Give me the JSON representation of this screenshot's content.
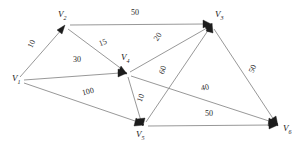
{
  "diagram": {
    "width": 303,
    "height": 148,
    "background_color": "#ffffff",
    "edge_color": "#8c8c8c",
    "arrow_color": "#1c1c1c",
    "label_color": "#151515"
  },
  "nodes": [
    {
      "id": "v1",
      "name": "V",
      "subscript": "1",
      "label": "V1",
      "x": 20,
      "y": 80,
      "label_x": 12,
      "label_y": 76
    },
    {
      "id": "v2",
      "name": "V",
      "subscript": "2",
      "label": "V2",
      "x": 65,
      "y": 28,
      "label_x": 58,
      "label_y": 12
    },
    {
      "id": "v3",
      "name": "V",
      "subscript": "3",
      "label": "V3",
      "x": 210,
      "y": 24,
      "label_x": 215,
      "label_y": 12
    },
    {
      "id": "v4",
      "name": "V",
      "subscript": "4",
      "label": "V4",
      "x": 126,
      "y": 74,
      "label_x": 122,
      "label_y": 55
    },
    {
      "id": "v5",
      "name": "V",
      "subscript": "5",
      "label": "V5",
      "x": 143,
      "y": 126,
      "label_x": 136,
      "label_y": 130
    },
    {
      "id": "v6",
      "name": "V",
      "subscript": "6",
      "label": "V6",
      "x": 277,
      "y": 125,
      "label_x": 283,
      "label_y": 124
    }
  ],
  "edges": [
    {
      "id": "e-v1-v2",
      "from": "v1",
      "to": "v2",
      "weight": "10",
      "label_x": 33,
      "label_y": 44,
      "rotate": -64
    },
    {
      "id": "e-v2-v3",
      "from": "v2",
      "to": "v3",
      "weight": "50",
      "label_x": 136,
      "label_y": 13,
      "rotate": 0
    },
    {
      "id": "e-v2-v4",
      "from": "v2",
      "to": "v4",
      "weight": "15",
      "label_x": 104,
      "label_y": 43,
      "rotate": -22
    },
    {
      "id": "e-v1-v4",
      "from": "v1",
      "to": "v4",
      "weight": "30",
      "label_x": 78,
      "label_y": 60,
      "rotate": 0
    },
    {
      "id": "e-v1-v5",
      "from": "v1",
      "to": "v5",
      "weight": "100",
      "label_x": 89,
      "label_y": 92,
      "rotate": -14
    },
    {
      "id": "e-v4-v3",
      "from": "v4",
      "to": "v3",
      "weight": "20",
      "label_x": 159,
      "label_y": 37,
      "rotate": -56
    },
    {
      "id": "e-v4-v5",
      "from": "v4",
      "to": "v5",
      "weight": "10",
      "label_x": 142,
      "label_y": 98,
      "rotate": -70
    },
    {
      "id": "e-v4-v6",
      "from": "v4",
      "to": "v6",
      "weight": "40",
      "label_x": 206,
      "label_y": 88,
      "rotate": -12
    },
    {
      "id": "e-v5-v3",
      "from": "v5",
      "to": "v3",
      "weight": "60",
      "label_x": 164,
      "label_y": 70,
      "rotate": -72
    },
    {
      "id": "e-v3-v6",
      "from": "v3",
      "to": "v6",
      "weight": "50",
      "label_x": 254,
      "label_y": 69,
      "rotate": -66
    },
    {
      "id": "e-v5-v6",
      "from": "v5",
      "to": "v6",
      "weight": "50",
      "label_x": 210,
      "label_y": 114,
      "rotate": 0
    }
  ]
}
